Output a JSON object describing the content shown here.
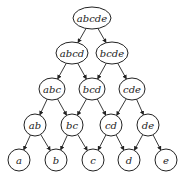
{
  "diagram": {
    "type": "lattice",
    "nodes": [
      {
        "id": "abcde",
        "label": "abcde",
        "x": 92,
        "y": 18,
        "rx": 19,
        "ry": 11
      },
      {
        "id": "abcd",
        "label": "abcd",
        "x": 72,
        "y": 53,
        "rx": 16,
        "ry": 11
      },
      {
        "id": "bcde",
        "label": "bcde",
        "x": 112,
        "y": 53,
        "rx": 16,
        "ry": 11
      },
      {
        "id": "abc",
        "label": "abc",
        "x": 52,
        "y": 89,
        "rx": 13,
        "ry": 11
      },
      {
        "id": "bcd",
        "label": "bcd",
        "x": 92,
        "y": 89,
        "rx": 13,
        "ry": 11
      },
      {
        "id": "cde",
        "label": "cde",
        "x": 132,
        "y": 89,
        "rx": 13,
        "ry": 11
      },
      {
        "id": "ab",
        "label": "ab",
        "x": 35,
        "y": 125,
        "rx": 11,
        "ry": 11
      },
      {
        "id": "bc",
        "label": "bc",
        "x": 72,
        "y": 125,
        "rx": 11,
        "ry": 11
      },
      {
        "id": "cd",
        "label": "cd",
        "x": 111,
        "y": 125,
        "rx": 11,
        "ry": 11
      },
      {
        "id": "de",
        "label": "de",
        "x": 148,
        "y": 125,
        "rx": 11,
        "ry": 11
      },
      {
        "id": "a",
        "label": "a",
        "x": 19,
        "y": 160,
        "rx": 11,
        "ry": 11
      },
      {
        "id": "b",
        "label": "b",
        "x": 56,
        "y": 160,
        "rx": 11,
        "ry": 11
      },
      {
        "id": "c",
        "label": "c",
        "x": 93,
        "y": 160,
        "rx": 11,
        "ry": 11
      },
      {
        "id": "d",
        "label": "d",
        "x": 129,
        "y": 160,
        "rx": 11,
        "ry": 11
      },
      {
        "id": "e",
        "label": "e",
        "x": 166,
        "y": 160,
        "rx": 11,
        "ry": 11
      }
    ],
    "edges": [
      [
        "abcde",
        "abcd"
      ],
      [
        "abcde",
        "bcde"
      ],
      [
        "abcd",
        "abc"
      ],
      [
        "abcd",
        "bcd"
      ],
      [
        "bcde",
        "bcd"
      ],
      [
        "bcde",
        "cde"
      ],
      [
        "abc",
        "ab"
      ],
      [
        "abc",
        "bc"
      ],
      [
        "bcd",
        "bc"
      ],
      [
        "bcd",
        "cd"
      ],
      [
        "cde",
        "cd"
      ],
      [
        "cde",
        "de"
      ],
      [
        "ab",
        "a"
      ],
      [
        "ab",
        "b"
      ],
      [
        "bc",
        "b"
      ],
      [
        "bc",
        "c"
      ],
      [
        "cd",
        "c"
      ],
      [
        "cd",
        "d"
      ],
      [
        "de",
        "d"
      ],
      [
        "de",
        "e"
      ]
    ]
  }
}
